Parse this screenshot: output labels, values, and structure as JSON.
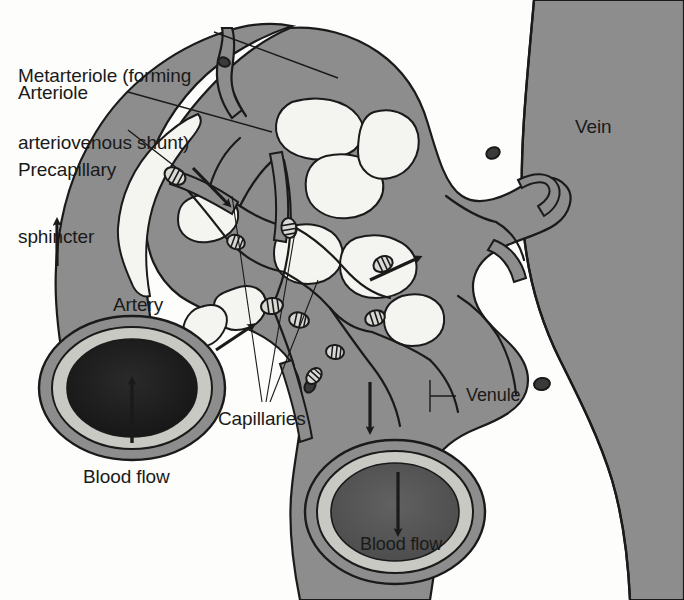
{
  "figure": {
    "background_color": "#fdfdfb"
  },
  "palette": {
    "vessel_fill": "#8d8d8d",
    "vessel_fill_light": "#9a9a9a",
    "outline": "#1a1a1a",
    "lumen_artery": "#1f1f1f",
    "lumen_vein": "#575757",
    "wall_ring": "#c9c9c4",
    "background": "#fdfdfb",
    "text": "#1a1a1a",
    "leader_line": "#1a1a1a",
    "capillary_highlight": "#f4f4f0"
  },
  "labels": {
    "metarteriole": {
      "line1": "Metarteriole (forming",
      "line2": "arteriovenous shunt)",
      "x": 18,
      "y": 22
    },
    "arteriole": {
      "text": "Arteriole",
      "x": 18,
      "y": 84
    },
    "precapillary_sphincter": {
      "line1": "Precapillary",
      "line2": "sphincter",
      "x": 18,
      "y": 116
    },
    "vein": {
      "text": "Vein",
      "x": 575,
      "y": 116
    },
    "artery": {
      "text": "Artery",
      "x": 113,
      "y": 295
    },
    "capillaries": {
      "text": "Capillaries",
      "x": 218,
      "y": 408
    },
    "venule": {
      "text": "Venule",
      "x": 465,
      "y": 392
    },
    "blood_flow_artery": {
      "text": "Blood flow",
      "x": 83,
      "y": 467
    },
    "blood_flow_vein": {
      "text": "Blood flow",
      "x": 362,
      "y": 538
    }
  },
  "annotations": {
    "flow_arrows": [
      {
        "name": "artery-upward-arrow",
        "direction": "up",
        "location": "left artery trunk"
      },
      {
        "name": "arteriole-flow-arrow",
        "direction": "down-right",
        "location": "below precapillary sphincter"
      },
      {
        "name": "capillary-bed-flow-arrow",
        "direction": "up-right",
        "location": "lower-left of capillary bed"
      },
      {
        "name": "venule-inflow-arrow",
        "direction": "up-right",
        "location": "center-right of capillary bed"
      },
      {
        "name": "venule-downward-arrow",
        "direction": "down",
        "location": "descending venule"
      },
      {
        "name": "artery-cross-section-arrow",
        "direction": "up",
        "location": "artery cross-section lumen"
      },
      {
        "name": "vein-cross-section-arrow",
        "direction": "down",
        "location": "vein cross-section lumen"
      }
    ],
    "precapillary_sphincters_count": 9,
    "cross_sections": [
      {
        "name": "artery-cross-section",
        "vessel": "Artery",
        "flow": "up"
      },
      {
        "name": "vein-cross-section",
        "vessel": "Vein",
        "flow": "down"
      }
    ]
  }
}
